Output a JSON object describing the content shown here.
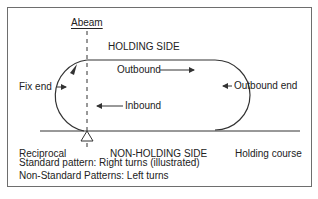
{
  "diagram": {
    "type": "holding-pattern",
    "labels": {
      "abeam": "Abeam",
      "holding_side": "HOLDING SIDE",
      "outbound": "Outbound",
      "inbound": "Inbound",
      "fix_end": "Fix end",
      "outbound_end": "Outbound end",
      "reciprocal": "Reciprocal",
      "non_holding_side": "NON-HOLDING SIDE",
      "holding_course": "Holding course"
    },
    "notes": [
      "Standard pattern: Right turns (illustrated)",
      "Non-Standard Patterns: Left turns"
    ],
    "colors": {
      "line": "#333333",
      "frame": "#6e6e6e",
      "text": "#222222"
    }
  }
}
